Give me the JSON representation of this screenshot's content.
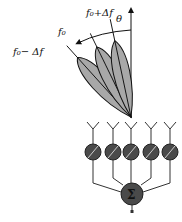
{
  "diagram": {
    "title": "",
    "labels": {
      "theta": "θ",
      "beam_high": "f₀+Δf",
      "beam_center": "f₀",
      "beam_low": "f₀− Δf",
      "summer": "Σ"
    },
    "beams": [
      {
        "name": "f0-plus-delta",
        "label": "f₀+Δf",
        "angle_deg": -12
      },
      {
        "name": "f0",
        "label": "f₀",
        "angle_deg": -26
      },
      {
        "name": "f0-minus-delta",
        "label": "f₀− Δf",
        "angle_deg": -42
      }
    ],
    "antenna_elements": 5,
    "colors": {
      "lobe_fill": "#a8a8a8",
      "phase_shifter_fill": "#4a4a4a",
      "line": "#111111"
    }
  }
}
